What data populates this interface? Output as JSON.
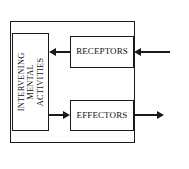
{
  "diagram": {
    "type": "block-flow-diagram",
    "background_color": "#ffffff",
    "line_color": "#1a1a1a",
    "nodes": {
      "organism_boundary": {
        "name": "outer-system-boundary",
        "label": ""
      },
      "mental": {
        "label_lines": [
          "INTERVENING",
          "MENTAL",
          "ACTIVITIES"
        ],
        "line1": "INTERVENING",
        "line2": "MENTAL",
        "line3": "ACTIVITIES",
        "orientation": "vertical-rotated-90-ccw"
      },
      "receptors": {
        "label": "RECEPTORS",
        "orientation": "horizontal"
      },
      "effectors": {
        "label": "EFFECTORS",
        "orientation": "horizontal"
      }
    },
    "captions": {
      "external_environment": "EXTERNAL ENVIRONMENT"
    },
    "connectors": [
      {
        "id": "env-to-receptors",
        "from": "EXTERNAL ENVIRONMENT",
        "to": "RECEPTORS",
        "direction": "left"
      },
      {
        "id": "receptors-to-mental",
        "from": "RECEPTORS",
        "to": "INTERVENING MENTAL ACTIVITIES",
        "direction": "left"
      },
      {
        "id": "mental-to-effectors",
        "from": "INTERVENING MENTAL ACTIVITIES",
        "to": "EFFECTORS",
        "direction": "right"
      },
      {
        "id": "effectors-to-env",
        "from": "EFFECTORS",
        "to": "EXTERNAL ENVIRONMENT",
        "direction": "right"
      }
    ]
  }
}
